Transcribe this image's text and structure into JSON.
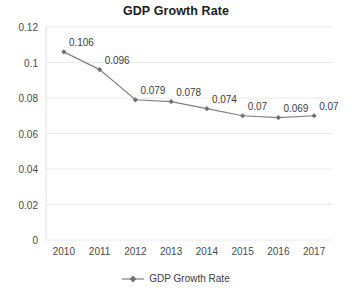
{
  "chart_data": {
    "type": "line",
    "title": "GDP Growth Rate",
    "xlabel": "",
    "ylabel": "",
    "categories": [
      "2010",
      "2011",
      "2012",
      "2013",
      "2014",
      "2015",
      "2016",
      "2017"
    ],
    "values": [
      0.106,
      0.096,
      0.079,
      0.078,
      0.074,
      0.07,
      0.069,
      0.07
    ],
    "point_labels": [
      "0.106",
      "0.096",
      "0.079",
      "0.078",
      "0.074",
      "0.07",
      "0.069",
      "0.07"
    ],
    "series": [
      {
        "name": "GDP Growth Rate",
        "values": [
          0.106,
          0.096,
          0.079,
          0.078,
          0.074,
          0.07,
          0.069,
          0.07
        ]
      }
    ],
    "ylim": [
      0,
      0.12
    ],
    "y_ticks": [
      0,
      0.02,
      0.04,
      0.06,
      0.08,
      0.1,
      0.12
    ],
    "y_tick_labels": [
      "0",
      "0.02",
      "0.04",
      "0.06",
      "0.08",
      "0.1",
      "0.12"
    ],
    "grid": true,
    "grid_axis": "y",
    "legend": {
      "position": "bottom",
      "entries": [
        "GDP Growth Rate"
      ]
    },
    "colors": {
      "line": "#808080",
      "marker": "#707070",
      "grid": "#e8e8e8",
      "axis": "#e0e0e0",
      "text": "#3d3d3d",
      "title": "#1c1c1c",
      "background": "#ffffff"
    },
    "marker_shape": "diamond"
  }
}
